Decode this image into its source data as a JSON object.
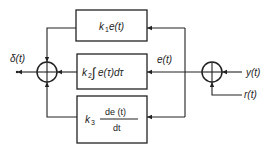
{
  "diagram": {
    "type": "block-diagram",
    "blocks": [
      {
        "id": "proportional",
        "gain": "k",
        "gain_sub": "1",
        "expr": "e(t)"
      },
      {
        "id": "integral",
        "gain": "k",
        "gain_sub": "2",
        "expr_int": "∫",
        "expr": "e(τ)dτ"
      },
      {
        "id": "derivative",
        "gain": "k",
        "gain_sub": "3",
        "numerator": "de (t)",
        "denominator": "dt"
      }
    ],
    "signals": {
      "output": "δ(t)",
      "error": "e(t)",
      "measured": "y(t)",
      "reference": "r(t)"
    },
    "junctions": [
      {
        "id": "left-sum",
        "role": "sum of P, I, D terms"
      },
      {
        "id": "right-sum",
        "role": "error computation"
      }
    ]
  }
}
